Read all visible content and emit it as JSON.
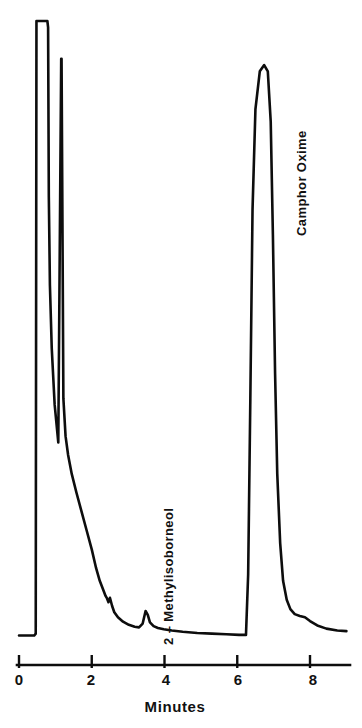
{
  "chart_data": {
    "type": "line",
    "title": "",
    "subtitle": "",
    "xlabel": "Minutes",
    "ylabel": "",
    "xlim": [
      0,
      9
    ],
    "ylim": [
      0,
      100
    ],
    "grid": false,
    "legend": "none",
    "xticks": [
      0,
      2,
      4,
      6,
      8
    ],
    "xtick_labels": [
      "0",
      "2",
      "4",
      "6",
      "8"
    ],
    "annotations": [
      {
        "text": "2 – Methylisoborneol",
        "x_minutes": 3.5,
        "rotation": -90
      },
      {
        "text": "Camphor Oxime",
        "x_minutes": 6.9,
        "rotation": -90
      }
    ],
    "peaks": [
      {
        "name": "solvent-front",
        "label": "",
        "retention_minutes": 0.75,
        "height_percent": 100,
        "off_scale": true,
        "note": "flat-topped, off-scale"
      },
      {
        "name": "unresolved-spike",
        "label": "",
        "retention_minutes": 1.2,
        "height_percent": 94,
        "off_scale": false
      },
      {
        "name": "minor-shoulder",
        "label": "",
        "retention_minutes": 2.4,
        "height_percent": 7,
        "off_scale": false
      },
      {
        "name": "2-methylisoborneol",
        "label": "2 – Methylisoborneol",
        "retention_minutes": 3.5,
        "height_percent": 6,
        "off_scale": false
      },
      {
        "name": "camphor-oxime",
        "label": "Camphor Oxime",
        "retention_minutes": 6.85,
        "height_percent": 92,
        "off_scale": false
      }
    ],
    "trace_points": [
      [
        0.0,
        2.3
      ],
      [
        0.42,
        2.3
      ],
      [
        0.46,
        2.6
      ],
      [
        0.48,
        100
      ],
      [
        0.49,
        100
      ],
      [
        0.75,
        100
      ],
      [
        0.78,
        100
      ],
      [
        0.8,
        99
      ],
      [
        0.82,
        72
      ],
      [
        0.85,
        58
      ],
      [
        0.9,
        48
      ],
      [
        0.98,
        39
      ],
      [
        1.08,
        33
      ],
      [
        1.16,
        94
      ],
      [
        1.17,
        94
      ],
      [
        1.2,
        62
      ],
      [
        1.22,
        40
      ],
      [
        1.28,
        34
      ],
      [
        1.35,
        31
      ],
      [
        1.45,
        28
      ],
      [
        1.58,
        25
      ],
      [
        1.72,
        22
      ],
      [
        1.86,
        19
      ],
      [
        2.0,
        16
      ],
      [
        2.12,
        13
      ],
      [
        2.22,
        11
      ],
      [
        2.32,
        9.5
      ],
      [
        2.38,
        8.6
      ],
      [
        2.42,
        8.2
      ],
      [
        2.46,
        7.6
      ],
      [
        2.5,
        8.3
      ],
      [
        2.56,
        7.0
      ],
      [
        2.62,
        6.0
      ],
      [
        2.72,
        5.2
      ],
      [
        2.86,
        4.5
      ],
      [
        3.02,
        4.0
      ],
      [
        3.18,
        3.7
      ],
      [
        3.3,
        3.6
      ],
      [
        3.4,
        4.2
      ],
      [
        3.48,
        6.2
      ],
      [
        3.54,
        5.6
      ],
      [
        3.6,
        4.4
      ],
      [
        3.7,
        3.8
      ],
      [
        3.82,
        3.5
      ],
      [
        3.98,
        3.3
      ],
      [
        4.2,
        3.1
      ],
      [
        4.5,
        2.9
      ],
      [
        4.9,
        2.7
      ],
      [
        5.3,
        2.6
      ],
      [
        5.7,
        2.5
      ],
      [
        6.05,
        2.4
      ],
      [
        6.18,
        2.4
      ],
      [
        6.24,
        2.4
      ],
      [
        6.3,
        12
      ],
      [
        6.36,
        40
      ],
      [
        6.42,
        70
      ],
      [
        6.5,
        86
      ],
      [
        6.62,
        92
      ],
      [
        6.74,
        93
      ],
      [
        6.84,
        92
      ],
      [
        6.92,
        84
      ],
      [
        6.98,
        66
      ],
      [
        7.04,
        44
      ],
      [
        7.1,
        28
      ],
      [
        7.18,
        17
      ],
      [
        7.26,
        11
      ],
      [
        7.36,
        8.0
      ],
      [
        7.46,
        6.5
      ],
      [
        7.58,
        5.7
      ],
      [
        7.72,
        5.4
      ],
      [
        7.86,
        5.2
      ],
      [
        8.0,
        4.6
      ],
      [
        8.2,
        3.9
      ],
      [
        8.45,
        3.4
      ],
      [
        8.75,
        3.1
      ],
      [
        9.0,
        3.0
      ]
    ]
  },
  "axis": {
    "x_label": "Minutes",
    "tick_0": "0",
    "tick_2": "2",
    "tick_4": "4",
    "tick_6": "6",
    "tick_8": "8"
  },
  "labels": {
    "methylisoborneol": "2 – Methylisoborneol",
    "camphor_oxime": "Camphor Oxime"
  },
  "colors": {
    "trace": "#0d0d0d",
    "axis": "#0d0d0d",
    "background": "#ffffff",
    "text": "#111111"
  }
}
